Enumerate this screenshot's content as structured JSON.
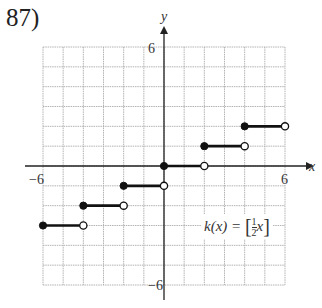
{
  "problem": {
    "number": "87)"
  },
  "chart_data": {
    "type": "line",
    "subtype": "step-function",
    "title": "",
    "function_label": "k(x) = [½x]",
    "xlabel": "x",
    "ylabel": "y",
    "xlim": [
      -6,
      6
    ],
    "ylim": [
      -6,
      6
    ],
    "grid": true,
    "grid_step": 1,
    "tick_labels": {
      "x": [
        "-6",
        "6"
      ],
      "y": [
        "6",
        "-6"
      ]
    },
    "segments": [
      {
        "x_start": -6,
        "x_end": -4,
        "y": -3,
        "start": "closed",
        "end": "open"
      },
      {
        "x_start": -4,
        "x_end": -2,
        "y": -2,
        "start": "closed",
        "end": "open"
      },
      {
        "x_start": -2,
        "x_end": 0,
        "y": -1,
        "start": "closed",
        "end": "open"
      },
      {
        "x_start": 0,
        "x_end": 2,
        "y": 0,
        "start": "closed",
        "end": "open"
      },
      {
        "x_start": 2,
        "x_end": 4,
        "y": 1,
        "start": "closed",
        "end": "open"
      },
      {
        "x_start": 4,
        "x_end": 6,
        "y": 2,
        "start": "closed",
        "end": "open"
      }
    ]
  },
  "labels": {
    "x_axis": "x",
    "y_axis": "y",
    "x_min": "−6",
    "x_max": "6",
    "y_max": "6",
    "y_min": "−6",
    "fn_prefix": "k(x) = ",
    "fn_num": "1",
    "fn_den": "2",
    "fn_var": "x"
  },
  "colors": {
    "grid": "#aaaaaa",
    "axis": "#222222",
    "line": "#111111"
  }
}
